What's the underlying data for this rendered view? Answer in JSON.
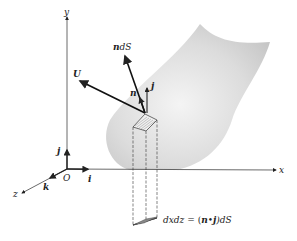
{
  "figure": {
    "axes": {
      "x_label": "x",
      "y_label": "y",
      "z_label": "z",
      "origin_label": "O"
    },
    "unit_vectors": {
      "i": "i",
      "j": "j",
      "k": "k"
    },
    "vectors": {
      "U": "U",
      "ndS": "n",
      "ndS_suffix": "dS",
      "n": "n",
      "j_at_surface": "j"
    },
    "equation": {
      "lhs": "dxdz",
      "eq": "=",
      "rhs_open": "(",
      "rhs_n": "n",
      "rhs_dot": "•",
      "rhs_j": "j",
      "rhs_close": ")dS"
    },
    "colors": {
      "surface_light": "#f2f2f2",
      "surface_dark": "#c8c8c8",
      "ink": "#222222"
    }
  }
}
